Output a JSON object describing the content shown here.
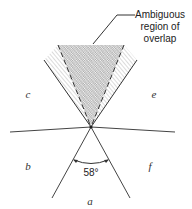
{
  "callout": {
    "lines": [
      "Ambiguous",
      "region of",
      "overlap"
    ]
  },
  "regions": {
    "a": "a",
    "b": "b",
    "c": "c",
    "e": "e",
    "f": "f"
  },
  "angle": {
    "label": "58°",
    "degrees": 58
  },
  "colors": {
    "line": "#333333",
    "hatch": "#b5b5b5",
    "crosshatch": "#9a9a9a"
  }
}
